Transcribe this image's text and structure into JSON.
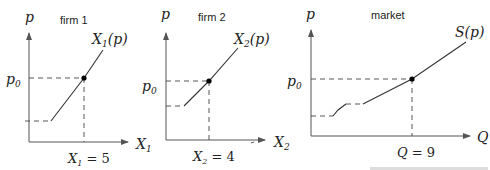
{
  "panels": [
    {
      "id": "firm1",
      "title": "firm 1",
      "y_label": "p",
      "x_label": "X",
      "x_label_sub": "1",
      "curve_label": "X",
      "curve_label_sub": "1",
      "curve_label_suffix": "(p)",
      "price_label": "p",
      "price_label_sub": "0",
      "quantity_label": "X",
      "quantity_label_sub": "1",
      "quantity_value": " = 5"
    },
    {
      "id": "firm2",
      "title": "firm 2",
      "y_label": "p",
      "x_label": "X",
      "x_label_sub": "2",
      "curve_label": "X",
      "curve_label_sub": "2",
      "curve_label_suffix": "(p)",
      "price_label": "p",
      "price_label_sub": "0",
      "quantity_label": "X",
      "quantity_label_sub": "2",
      "quantity_value": " = 4"
    },
    {
      "id": "market",
      "title": "market",
      "y_label": "p",
      "x_label": "Q",
      "curve_label": "S(p)",
      "price_label": "p",
      "price_label_sub": "0",
      "quantity_label": "Q",
      "quantity_value": " = 9"
    }
  ],
  "colors": {
    "line": "#333333",
    "axis": "#555555",
    "background": "#ffffff"
  }
}
